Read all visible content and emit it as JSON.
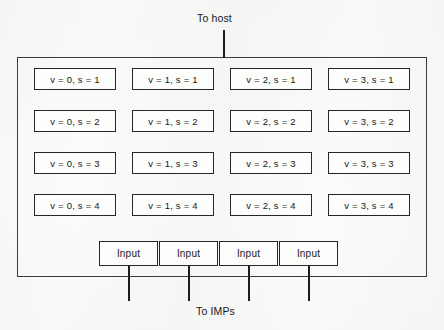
{
  "diagram": {
    "title_top": "To host",
    "title_bottom": "To IMPs",
    "outer_container_name": "host-queue-container",
    "colors": {
      "line": "#1b1d1f",
      "box_border": "#25282b",
      "outer_border": "#3a3d40",
      "text": "#16181a",
      "background": "#fbfbfa"
    },
    "queue_grid": {
      "columns": 4,
      "rows": 4,
      "cells": [
        {
          "v": 0,
          "s": 1,
          "label": "v = 0, s = 1"
        },
        {
          "v": 1,
          "s": 1,
          "label": "v = 1, s = 1"
        },
        {
          "v": 2,
          "s": 1,
          "label": "v = 2, s = 1"
        },
        {
          "v": 3,
          "s": 1,
          "label": "v = 3, s = 1"
        },
        {
          "v": 0,
          "s": 2,
          "label": "v = 0, s = 2"
        },
        {
          "v": 1,
          "s": 2,
          "label": "v = 1, s = 2"
        },
        {
          "v": 2,
          "s": 2,
          "label": "v = 2, s = 2"
        },
        {
          "v": 3,
          "s": 2,
          "label": "v = 3, s = 2"
        },
        {
          "v": 0,
          "s": 3,
          "label": "v = 0, s = 3"
        },
        {
          "v": 1,
          "s": 3,
          "label": "v = 1, s = 3"
        },
        {
          "v": 2,
          "s": 3,
          "label": "v = 2, s = 3"
        },
        {
          "v": 3,
          "s": 3,
          "label": "v = 3, s = 3"
        },
        {
          "v": 0,
          "s": 4,
          "label": "v = 0, s = 4"
        },
        {
          "v": 1,
          "s": 4,
          "label": "v = 1, s = 4"
        },
        {
          "v": 2,
          "s": 4,
          "label": "v = 2, s = 4"
        },
        {
          "v": 3,
          "s": 4,
          "label": "v = 3, s = 4"
        }
      ]
    },
    "input_boxes": [
      {
        "label": "Input"
      },
      {
        "label": "Input"
      },
      {
        "label": "Input"
      },
      {
        "label": "Input"
      }
    ]
  }
}
